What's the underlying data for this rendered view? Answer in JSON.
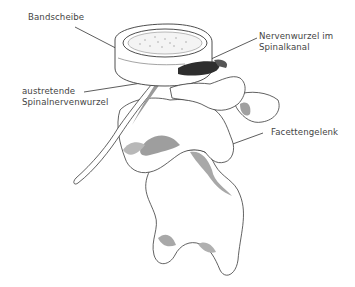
{
  "diagram": {
    "labels": {
      "disc": "Bandscheibe",
      "nerve_root_canal_line1": "Nervenwurzel im",
      "nerve_root_canal_line2": "Spinalkanal",
      "exiting_nerve_line1": "austretende",
      "exiting_nerve_line2": "Spinalnervenwurzel",
      "facet_joint": "Facettengelenk"
    },
    "colors": {
      "background": "#ffffff",
      "outline": "#3a3a3a",
      "shading": "#a8a8a8",
      "nerve_dark": "#2e2e2e",
      "label_text": "#444444"
    }
  }
}
